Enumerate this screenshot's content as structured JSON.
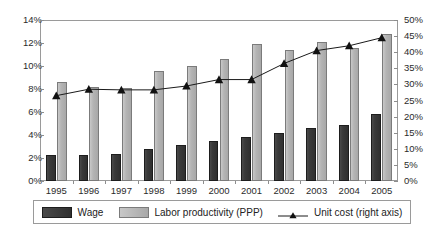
{
  "chart_data": {
    "type": "bar",
    "title": "",
    "subtitle": "",
    "xlabel": "",
    "ylabel": "",
    "categories": [
      "1995",
      "1996",
      "1997",
      "1998",
      "1999",
      "2000",
      "2001",
      "2002",
      "2003",
      "2004",
      "2005"
    ],
    "series": [
      {
        "name": "Wage",
        "axis": "left",
        "type": "bar",
        "color": "#333333",
        "values": [
          2.3,
          2.3,
          2.35,
          2.8,
          3.1,
          3.5,
          3.8,
          4.2,
          4.6,
          4.9,
          5.8
        ]
      },
      {
        "name": "Labor productivity (PPP)",
        "axis": "left",
        "type": "bar",
        "color": "#b4b4b4",
        "values": [
          8.6,
          8.2,
          8.1,
          9.6,
          10.0,
          10.6,
          11.9,
          11.4,
          12.1,
          11.6,
          12.8
        ]
      },
      {
        "name": "Unit cost (right axis)",
        "axis": "right",
        "type": "line",
        "color": "#1a1a1a",
        "marker": "triangle",
        "values": [
          26.5,
          28.5,
          28.3,
          28.3,
          29.5,
          31.5,
          31.5,
          36.5,
          40.5,
          42.0,
          44.5
        ]
      }
    ],
    "left_axis": {
      "ylim": [
        0,
        14
      ],
      "tick_step": 2,
      "ticks": [
        "0%",
        "2%",
        "4%",
        "6%",
        "8%",
        "10%",
        "12%",
        "14%"
      ]
    },
    "right_axis": {
      "ylim": [
        0,
        50
      ],
      "tick_step": 5,
      "ticks": [
        "0%",
        "5%",
        "10%",
        "15%",
        "20%",
        "25%",
        "30%",
        "35%",
        "40%",
        "45%",
        "50%"
      ]
    },
    "grid": false,
    "legend_position": "bottom",
    "legend": [
      {
        "label": "Wage",
        "marker": "bar-dark"
      },
      {
        "label": "Labor productivity (PPP)",
        "marker": "bar-light"
      },
      {
        "label": "Unit cost (right axis)",
        "marker": "line-triangle"
      }
    ]
  }
}
